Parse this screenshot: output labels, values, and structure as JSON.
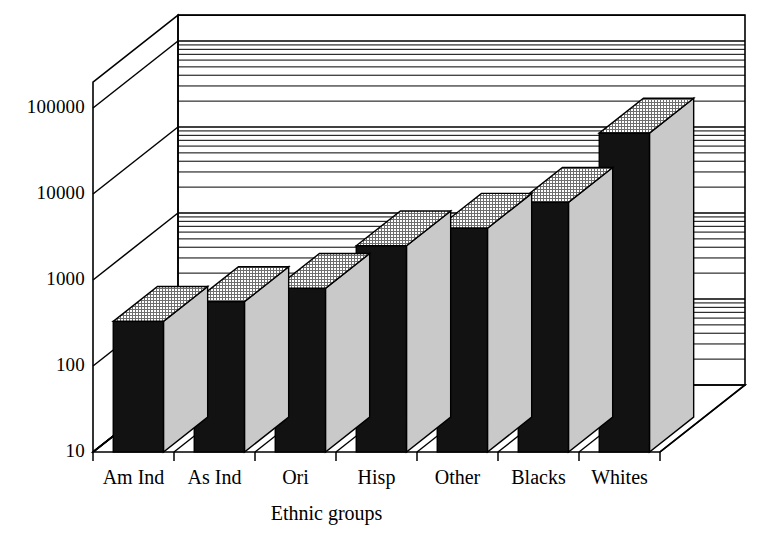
{
  "chart_data": {
    "type": "bar",
    "title": "",
    "subtitle": "",
    "xlabel": "Ethnic groups",
    "ylabel": "",
    "scale": "log",
    "grid": true,
    "legend": "none",
    "three_d": true,
    "categories": [
      "Am Ind",
      "As Ind",
      "Ori",
      "Hisp",
      "Other",
      "Blacks",
      "Whites"
    ],
    "values": [
      330,
      560,
      800,
      2500,
      4000,
      8000,
      51000
    ],
    "ytick_labels": [
      "100000",
      "10000",
      "1000",
      "100",
      "10"
    ],
    "ytick_values": [
      100000,
      10000,
      1000,
      100,
      10
    ],
    "ylim": [
      10,
      200000
    ],
    "minor_ticks_per_decade": [
      2,
      3,
      4,
      5,
      6,
      7,
      8,
      9
    ],
    "series": [
      {
        "name": "Count",
        "points": [
          {
            "category": "Am Ind",
            "value": 330
          },
          {
            "category": "As Ind",
            "value": 560
          },
          {
            "category": "Ori",
            "value": 800
          },
          {
            "category": "Hisp",
            "value": 2500
          },
          {
            "category": "Other",
            "value": 4000
          },
          {
            "category": "Blacks",
            "value": 8000
          },
          {
            "category": "Whites",
            "value": 51000
          }
        ]
      }
    ],
    "colors": {
      "bar_front": "#121212",
      "bar_side": "#c9c9c9",
      "bar_top": "#a8a8a8",
      "axis": "#000000",
      "background": "#ffffff"
    }
  },
  "axis": {
    "x_title": "Ethnic groups",
    "y_labels": [
      "100000",
      "10000",
      "1000",
      "100",
      "10"
    ],
    "x_labels": [
      "Am Ind",
      "As Ind",
      "Ori",
      "Hisp",
      "Other",
      "Blacks",
      "Whites"
    ]
  }
}
